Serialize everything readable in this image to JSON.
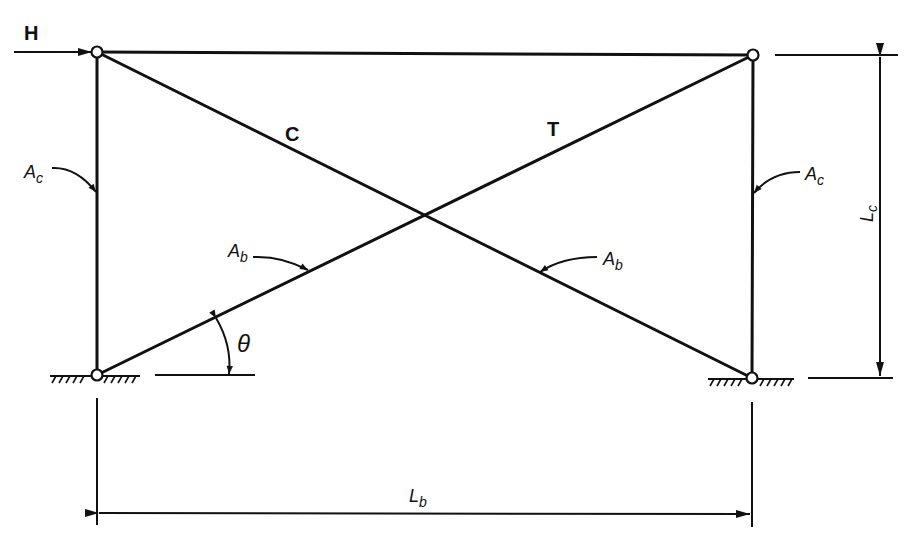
{
  "diagram": {
    "load": {
      "label": "H",
      "direction": "right"
    },
    "members": {
      "diagonal_compression_label": "C",
      "diagonal_tension_label": "T",
      "column_area_left": {
        "main": "A",
        "sub": "c"
      },
      "column_area_right": {
        "main": "A",
        "sub": "c"
      },
      "brace_area_left": {
        "main": "A",
        "sub": "b"
      },
      "brace_area_right": {
        "main": "A",
        "sub": "b"
      }
    },
    "angle_label": "θ",
    "dimensions": {
      "height": {
        "main": "L",
        "sub": "c"
      },
      "width": {
        "main": "L",
        "sub": "b"
      }
    },
    "supports": [
      "pinned-left",
      "pinned-right"
    ],
    "colors": {
      "line": "#111111",
      "background": "#ffffff"
    }
  }
}
